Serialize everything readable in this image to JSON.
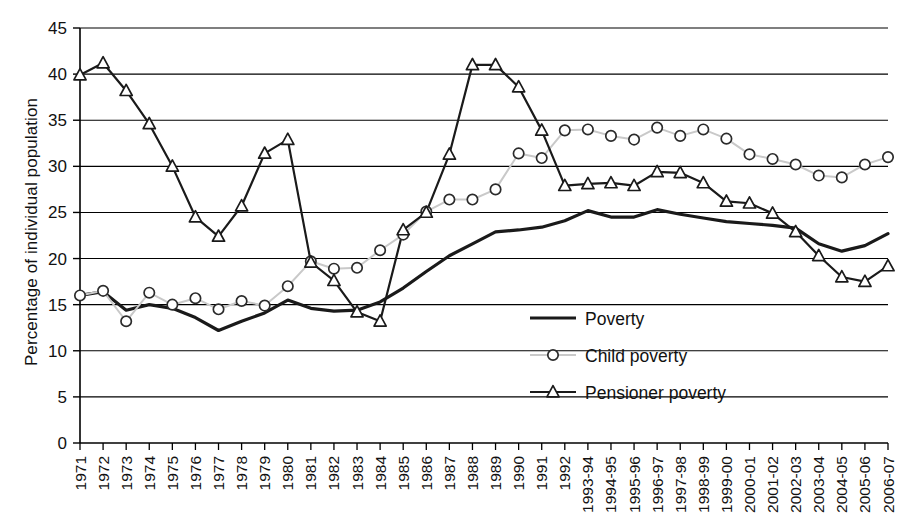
{
  "chart_data": {
    "type": "line",
    "title": "",
    "xlabel": "",
    "ylabel": "Percentage of individual population",
    "ylim": [
      0,
      45
    ],
    "ytick_step": 5,
    "yticks": [
      0,
      5,
      10,
      15,
      20,
      25,
      30,
      35,
      40,
      45
    ],
    "grid": true,
    "grid_axis": "y",
    "legend_position": "inside-center-right",
    "categories": [
      "1971",
      "1972",
      "1973",
      "1974",
      "1975",
      "1976",
      "1977",
      "1978",
      "1979",
      "1980",
      "1981",
      "1982",
      "1983",
      "1984",
      "1985",
      "1986",
      "1987",
      "1988",
      "1989",
      "1990",
      "1991",
      "1992",
      "1993-94",
      "1994-95",
      "1995-96",
      "1996-97",
      "1997-98",
      "1998-99",
      "1999-00",
      "2000-01",
      "2001-02",
      "2002-03",
      "2003-04",
      "2004-05",
      "2005-06",
      "2006-07"
    ],
    "series": [
      {
        "name": "Poverty",
        "marker": "none",
        "color": "#1a1a1a",
        "width": 3.2,
        "values": [
          16.0,
          16.4,
          14.4,
          15.0,
          14.6,
          13.6,
          12.2,
          13.2,
          14.1,
          15.5,
          14.6,
          14.3,
          14.4,
          15.3,
          16.8,
          18.6,
          20.3,
          21.6,
          22.9,
          23.1,
          23.4,
          24.1,
          25.2,
          24.5,
          24.5,
          25.3,
          24.8,
          24.4,
          24.0,
          23.8,
          23.6,
          23.3,
          21.6,
          20.8,
          21.4,
          22.7
        ]
      },
      {
        "name": "Child poverty",
        "marker": "circle",
        "color": "#c9c9c9",
        "marker_stroke": "#2b2b2b",
        "width": 2.0,
        "values": [
          16.0,
          16.5,
          13.2,
          16.3,
          15.0,
          15.7,
          14.5,
          15.4,
          14.9,
          17.0,
          19.7,
          18.9,
          19.0,
          20.9,
          22.6,
          25.1,
          26.4,
          26.4,
          27.5,
          31.4,
          30.9,
          33.9,
          34.0,
          33.3,
          32.9,
          34.2,
          33.3,
          34.0,
          33.0,
          31.3,
          30.8,
          30.2,
          29.0,
          28.8,
          30.2,
          31.0
        ]
      },
      {
        "name": "Pensioner poverty",
        "marker": "triangle",
        "color": "#1a1a1a",
        "marker_stroke": "#1a1a1a",
        "width": 2.2,
        "values": [
          39.9,
          41.2,
          38.2,
          34.6,
          30.0,
          24.5,
          22.4,
          25.7,
          31.4,
          32.9,
          19.6,
          17.6,
          14.2,
          13.2,
          23.1,
          25.0,
          31.3,
          41.0,
          41.0,
          38.6,
          33.9,
          27.9,
          28.1,
          28.2,
          27.9,
          29.4,
          29.3,
          28.2,
          26.2,
          26.0,
          24.9,
          22.9,
          20.3,
          18.0,
          17.5,
          19.2
        ]
      }
    ]
  },
  "legend": {
    "items": [
      {
        "label": "Poverty"
      },
      {
        "label": "Child poverty"
      },
      {
        "label": "Pensioner poverty"
      }
    ]
  }
}
